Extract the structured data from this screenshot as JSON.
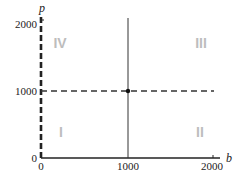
{
  "diagram": {
    "axes": {
      "x_label": "b",
      "y_label": "p",
      "x_ticks": [
        "0",
        "1000",
        "2000"
      ],
      "y_ticks": [
        "0",
        "1000",
        "2000"
      ]
    },
    "quadrants": {
      "q1": "I",
      "q2": "II",
      "q3": "III",
      "q4": "IV"
    },
    "lines": {
      "vertical_solid_at_b": 1000,
      "horizontal_dashed_at_p": 1000,
      "vertical_dashed_at_b": 0
    },
    "point": {
      "b": 1000,
      "p": 1000
    },
    "colors": {
      "axis": "#222222",
      "quadrant_label": "#bdbdbd"
    }
  }
}
